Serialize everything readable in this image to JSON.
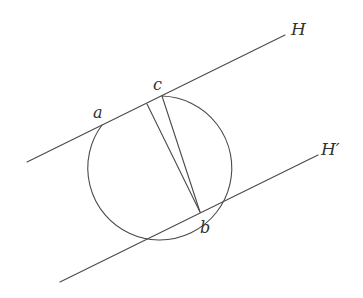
{
  "diagram": {
    "lines": [
      {
        "id": "H",
        "label": "H",
        "x1": 27,
        "y1": 162,
        "x2": 285,
        "y2": 35,
        "label_x": 292,
        "label_y": 35
      },
      {
        "id": "H-prime",
        "label": "H′",
        "x1": 60,
        "y1": 282,
        "x2": 318,
        "y2": 155,
        "label_x": 321,
        "label_y": 155
      }
    ],
    "points": [
      {
        "id": "a",
        "label": "a",
        "x": 102,
        "y": 125,
        "label_x": 93,
        "label_y": 118
      },
      {
        "id": "c",
        "label": "c",
        "x": 162,
        "y": 96,
        "label_x": 153,
        "label_y": 90
      },
      {
        "id": "b",
        "label": "b",
        "x": 200,
        "y": 212,
        "label_x": 201,
        "label_y": 232
      }
    ],
    "arc": {
      "from": "a",
      "to": "c",
      "cx": 168,
      "cy": 157,
      "r": 72
    },
    "chords": [
      {
        "id": "chord-inner",
        "x1": 147,
        "y1": 104,
        "x2": 200,
        "y2": 212
      },
      {
        "id": "chord-cb",
        "x1": 162,
        "y1": 96,
        "x2": 200,
        "y2": 212
      }
    ],
    "colors": {
      "stroke": "#4a4a4a",
      "label": "#333333",
      "background": "#ffffff"
    }
  }
}
